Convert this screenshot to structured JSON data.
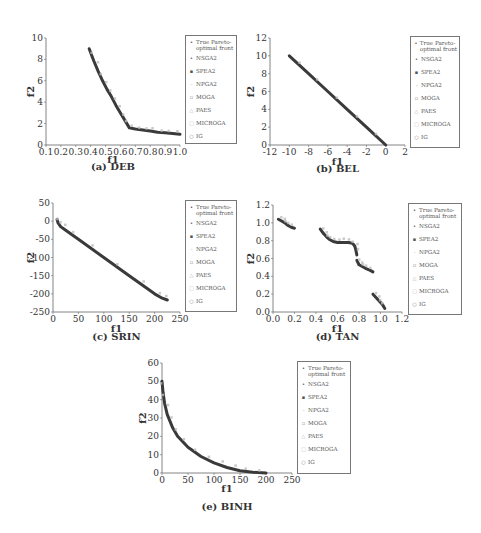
{
  "figure": {
    "legend": [
      {
        "label": "True Pareto-optimal front",
        "marker": "•",
        "color": "#333333"
      },
      {
        "label": "NSGA2",
        "marker": "•",
        "color": "#444444"
      },
      {
        "label": "SPEA2",
        "marker": "▪",
        "color": "#555555"
      },
      {
        "label": "NPGA2",
        "marker": "-",
        "color": "#999999"
      },
      {
        "label": "MOGA",
        "marker": "▫",
        "color": "#777777"
      },
      {
        "label": "PAES",
        "marker": "△",
        "color": "#aaaaaa"
      },
      {
        "label": "MICROGA",
        "marker": "□",
        "color": "#bbbbbb"
      },
      {
        "label": "IG",
        "marker": "○",
        "color": "#888888"
      }
    ]
  },
  "chart_data": [
    {
      "id": "deb",
      "type": "scatter",
      "title": "(a) DEB",
      "xlabel": "f1",
      "ylabel": "f2",
      "xlim": [
        0.1,
        1.0
      ],
      "ylim": [
        0,
        10
      ],
      "xticks": [
        "0.1",
        "0.2",
        "0.3",
        "0.4",
        "0.5",
        "0.6",
        "0.7",
        "0.8",
        "0.9",
        "1.0"
      ],
      "yticks": [
        "0",
        "2",
        "4",
        "6",
        "8",
        "10"
      ],
      "grid": false,
      "legend_position": "right",
      "series": [
        {
          "name": "True Pareto-optimal front",
          "x": [
            0.39,
            0.42,
            0.45,
            0.48,
            0.51,
            0.54,
            0.57,
            0.6,
            0.63,
            0.66,
            0.7,
            0.75,
            0.8,
            0.85,
            0.9,
            0.95,
            1.0
          ],
          "y": [
            9.0,
            7.9,
            6.9,
            6.0,
            5.2,
            4.5,
            3.7,
            3.0,
            2.3,
            1.6,
            1.5,
            1.4,
            1.3,
            1.2,
            1.15,
            1.08,
            1.0
          ]
        }
      ]
    },
    {
      "id": "bel",
      "type": "scatter",
      "title": "(b) BEL",
      "xlabel": "f1",
      "ylabel": "f2",
      "xlim": [
        -12,
        2
      ],
      "ylim": [
        0,
        12
      ],
      "xticks": [
        "-12",
        "-10",
        "-8",
        "-6",
        "-4",
        "-2",
        "0",
        "2"
      ],
      "yticks": [
        "0",
        "2",
        "4",
        "6",
        "8",
        "10",
        "12"
      ],
      "grid": false,
      "legend_position": "right",
      "series": [
        {
          "name": "True Pareto-optimal front",
          "x": [
            -10,
            -8,
            -6,
            -4,
            -2,
            0
          ],
          "y": [
            10,
            8,
            6,
            4,
            2,
            0
          ]
        }
      ]
    },
    {
      "id": "srin",
      "type": "scatter",
      "title": "(c) SRIN",
      "xlabel": "f1",
      "ylabel": "f2",
      "xlim": [
        0,
        250
      ],
      "ylim": [
        -250,
        50
      ],
      "xticks": [
        "0",
        "50",
        "100",
        "150",
        "200",
        "250"
      ],
      "yticks": [
        "-250",
        "-200",
        "-150",
        "-100",
        "-50",
        "0",
        "50"
      ],
      "grid": false,
      "legend_position": "right",
      "series": [
        {
          "name": "True Pareto-optimal front",
          "x": [
            8,
            10,
            15,
            25,
            50,
            100,
            150,
            200,
            215,
            225
          ],
          "y": [
            5,
            -5,
            -15,
            -25,
            -50,
            -100,
            -150,
            -200,
            -212,
            -217
          ]
        }
      ]
    },
    {
      "id": "tan",
      "type": "scatter",
      "title": "(d) TAN",
      "xlabel": "f1",
      "ylabel": "f2",
      "xlim": [
        0.0,
        1.2
      ],
      "ylim": [
        0.0,
        1.2
      ],
      "xticks": [
        "0.0",
        "0.2",
        "0.4",
        "0.6",
        "0.8",
        "1.0",
        "1.2"
      ],
      "yticks": [
        "0.0",
        "0.2",
        "0.4",
        "0.6",
        "0.8",
        "1.0",
        "1.2"
      ],
      "grid": false,
      "legend_position": "right",
      "series": [
        {
          "name": "True Pareto-optimal front",
          "segments": [
            {
              "x": [
                0.05,
                0.08,
                0.11,
                0.14,
                0.17,
                0.2
              ],
              "y": [
                1.04,
                1.02,
                1.0,
                0.97,
                0.95,
                0.94
              ]
            },
            {
              "x": [
                0.44,
                0.47,
                0.5,
                0.53,
                0.56,
                0.6,
                0.65,
                0.7,
                0.74,
                0.76,
                0.77,
                0.78
              ],
              "y": [
                0.93,
                0.88,
                0.84,
                0.81,
                0.79,
                0.78,
                0.78,
                0.78,
                0.77,
                0.74,
                0.7,
                0.64
              ]
            },
            {
              "x": [
                0.78,
                0.8,
                0.83,
                0.86,
                0.9,
                0.93
              ],
              "y": [
                0.58,
                0.53,
                0.51,
                0.49,
                0.47,
                0.45
              ]
            },
            {
              "x": [
                0.93,
                0.96,
                0.99,
                1.02,
                1.04
              ],
              "y": [
                0.2,
                0.16,
                0.12,
                0.08,
                0.04
              ]
            }
          ]
        }
      ]
    },
    {
      "id": "binh",
      "type": "scatter",
      "title": "(e) BINH",
      "xlabel": "f1",
      "ylabel": "f2",
      "xlim": [
        0,
        250
      ],
      "ylim": [
        0,
        60
      ],
      "xticks": [
        "0",
        "50",
        "100",
        "150",
        "200",
        "250"
      ],
      "yticks": [
        "0",
        "10",
        "20",
        "30",
        "40",
        "50",
        "60"
      ],
      "grid": false,
      "legend_position": "right",
      "series": [
        {
          "name": "True Pareto-optimal front",
          "x": [
            0,
            2,
            5,
            10,
            20,
            30,
            50,
            75,
            100,
            125,
            150,
            175,
            200
          ],
          "y": [
            50,
            44,
            38,
            32,
            25,
            20,
            14,
            9,
            5.5,
            3,
            1.2,
            0.4,
            0
          ]
        }
      ]
    }
  ]
}
